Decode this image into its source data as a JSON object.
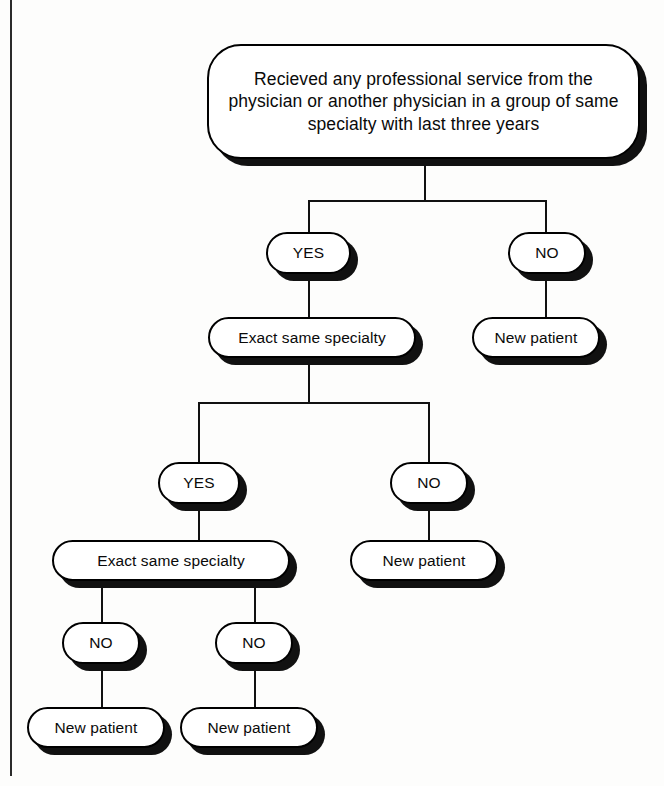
{
  "diagram": {
    "type": "decision-tree-flowchart",
    "colors": {
      "node_fill": "#ffffff",
      "node_stroke": "#000000",
      "shadow": "#111111",
      "connector": "#111111",
      "background": "#fdfdfc"
    }
  },
  "nodes": {
    "root": {
      "label": "Recieved any professional service from the physician or another physician in a group of same specialty with last three years",
      "kind": "question"
    },
    "lvl1_yes": {
      "label": "YES",
      "kind": "answer"
    },
    "lvl1_no": {
      "label": "NO",
      "kind": "answer"
    },
    "lvl2_question": {
      "label": "Exact same specialty",
      "kind": "question"
    },
    "lvl2_terminal": {
      "label": "New patient",
      "kind": "terminal"
    },
    "lvl2_yes": {
      "label": "YES",
      "kind": "answer"
    },
    "lvl2_no": {
      "label": "NO",
      "kind": "answer"
    },
    "lvl3_question": {
      "label": "Exact same specialty",
      "kind": "question"
    },
    "lvl3_terminal": {
      "label": "New patient",
      "kind": "terminal"
    },
    "lvl3_no_left": {
      "label": "NO",
      "kind": "answer"
    },
    "lvl3_no_right": {
      "label": "NO",
      "kind": "answer"
    },
    "lvl4_terminal_left": {
      "label": "New patient",
      "kind": "terminal"
    },
    "lvl4_terminal_right": {
      "label": "New patient",
      "kind": "terminal"
    }
  },
  "edges": [
    {
      "from": "root",
      "to": "lvl1_yes"
    },
    {
      "from": "root",
      "to": "lvl1_no"
    },
    {
      "from": "lvl1_yes",
      "to": "lvl2_question"
    },
    {
      "from": "lvl1_no",
      "to": "lvl2_terminal"
    },
    {
      "from": "lvl2_question",
      "to": "lvl2_yes"
    },
    {
      "from": "lvl2_question",
      "to": "lvl2_no"
    },
    {
      "from": "lvl2_yes",
      "to": "lvl3_question"
    },
    {
      "from": "lvl2_no",
      "to": "lvl3_terminal"
    },
    {
      "from": "lvl3_question",
      "to": "lvl3_no_left"
    },
    {
      "from": "lvl3_question",
      "to": "lvl3_no_right"
    },
    {
      "from": "lvl3_no_left",
      "to": "lvl4_terminal_left"
    },
    {
      "from": "lvl3_no_right",
      "to": "lvl4_terminal_right"
    }
  ]
}
